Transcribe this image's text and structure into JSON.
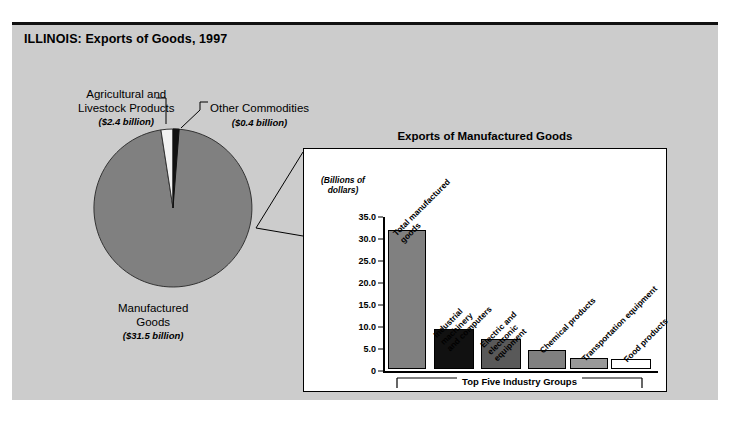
{
  "title": "ILLINOIS: Exports of Goods, 1997",
  "pie": {
    "labels": [
      {
        "name": "Agricultural and Livestock Products",
        "line1": "Agricultural and",
        "line2": "Livestock Products",
        "amount": "($2.4 billion)"
      },
      {
        "name": "Other Commodities",
        "line1": "Other Commodities",
        "line2": "",
        "amount": "($0.4 billion)"
      },
      {
        "name": "Manufactured Goods",
        "line1": "Manufactured",
        "line2": "Goods",
        "amount": "($31.5 billion)"
      }
    ]
  },
  "panel": {
    "title": "Exports of Manufactured Goods",
    "axis_unit_line1": "(Billions of",
    "axis_unit_line2": "dollars)",
    "bracket_label": "Top Five Industry Groups"
  },
  "chart_data": {
    "type": "pie",
    "title": "ILLINOIS: Exports of Goods, 1997",
    "unit": "billions of dollars",
    "labels": [
      "Manufactured Goods",
      "Agricultural and Livestock Products",
      "Other Commodities"
    ],
    "values": [
      31.5,
      2.4,
      0.4
    ],
    "value_labels": [
      "($31.5 billion)",
      "($2.4 billion)",
      "($0.4 billion)"
    ],
    "colors": [
      "#808080",
      "#ffffff",
      "#111111"
    ],
    "legend": "none",
    "inset": {
      "type": "bar",
      "title": "Exports of Manufactured Goods",
      "ylabel": "(Billions of dollars)",
      "xlabel": "",
      "ylim": [
        0,
        35
      ],
      "yticks": [
        0,
        5.0,
        10.0,
        15.0,
        20.0,
        25.0,
        30.0,
        35.0
      ],
      "ytick_labels": [
        "0",
        "5.0",
        "10.0",
        "15.0",
        "20.0",
        "25.0",
        "30.0",
        "35.0"
      ],
      "grid": false,
      "categories": [
        "Total manufactured goods",
        "Industrial machinery and computers",
        "Electric and electronic equipment",
        "Chemical products",
        "Transportation equipment",
        "Food products"
      ],
      "values": [
        31.5,
        9.1,
        6.8,
        4.3,
        2.5,
        2.3
      ],
      "colors": [
        "#808080",
        "#111111",
        "#595959",
        "#808080",
        "#999999",
        "#ffffff"
      ],
      "annotation": "Top Five Industry Groups",
      "annotation_covers": [
        "Industrial machinery and computers",
        "Electric and electronic equipment",
        "Chemical products",
        "Transportation equipment",
        "Food products"
      ]
    }
  }
}
